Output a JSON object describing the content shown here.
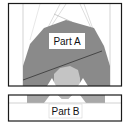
{
  "diagram": {
    "parts": [
      {
        "id": "part-a",
        "label": "Part A"
      },
      {
        "id": "part-b",
        "label": "Part B"
      }
    ],
    "colors": {
      "frame": "#1a1a1a",
      "dark_fill": "#8a8a8a",
      "light_fill": "#c4c4c4",
      "guide_line": "#bdbdbd",
      "background": "#ffffff"
    }
  }
}
